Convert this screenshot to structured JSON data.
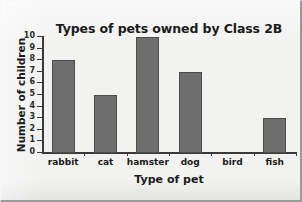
{
  "chart_data": {
    "type": "bar",
    "title": "Types of pets owned by Class 2B",
    "xlabel": "Type of pet",
    "ylabel": "Number of children",
    "categories": [
      "rabbit",
      "cat",
      "hamster",
      "dog",
      "bird",
      "fish"
    ],
    "values": [
      8,
      5,
      10,
      7,
      0,
      3
    ],
    "ylim": [
      0,
      10
    ],
    "ytick_labels": [
      "0",
      "1",
      "2",
      "3",
      "4",
      "5",
      "6",
      "7",
      "8",
      "9",
      "10"
    ],
    "ytick_values": [
      0,
      1,
      2,
      3,
      4,
      5,
      6,
      7,
      8,
      9,
      10
    ],
    "grid": false,
    "legend": false,
    "bar_color": "#6e6e6e",
    "bar_edge_color": "#4d4d4d",
    "axis_color": "#3a3a3a",
    "text_color": "#1b1b1b",
    "background_color": "#f2f2f1"
  }
}
